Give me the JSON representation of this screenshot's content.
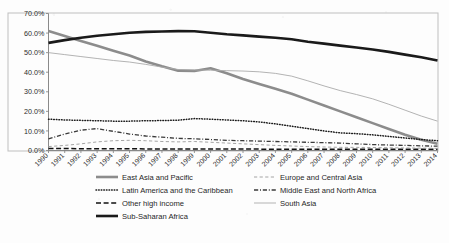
{
  "chart_data": {
    "type": "line",
    "title": "",
    "xlabel": "",
    "ylabel": "",
    "ylim": [
      0,
      70
    ],
    "ytick_labels": [
      "0.0%",
      "10.0%",
      "20.0%",
      "30.0%",
      "40.0%",
      "50.0%",
      "60.0%",
      "70.0%"
    ],
    "ytick_values": [
      0,
      10,
      20,
      30,
      40,
      50,
      60,
      70
    ],
    "grid": false,
    "legend_position": "bottom",
    "x": [
      1990,
      1991,
      1992,
      1993,
      1994,
      1995,
      1996,
      1997,
      1998,
      1999,
      2000,
      2001,
      2002,
      2003,
      2004,
      2005,
      2006,
      2007,
      2008,
      2009,
      2010,
      2011,
      2012,
      2013,
      2014
    ],
    "categories": [
      "1990",
      "1991",
      "1992",
      "1993",
      "1994",
      "1995",
      "1996",
      "1997",
      "1998",
      "1999",
      "2000",
      "2001",
      "2002",
      "2003",
      "2004",
      "2005",
      "2006",
      "2007",
      "2008",
      "2009",
      "2010",
      "2011",
      "2012",
      "2013",
      "2014"
    ],
    "series": [
      {
        "name": "East Asia and Pacific",
        "style": "solid-thick",
        "color": "#8c8c8c",
        "values": [
          61.0,
          58.5,
          56.0,
          53.5,
          51.0,
          48.5,
          45.5,
          43.0,
          40.8,
          40.6,
          42.0,
          39.5,
          36.5,
          34.0,
          31.5,
          29.0,
          26.0,
          23.0,
          20.0,
          17.0,
          14.0,
          11.0,
          8.0,
          5.5,
          3.5
        ]
      },
      {
        "name": "Latin America and the Caribbean",
        "style": "dotted",
        "color": "#1a1a1a",
        "values": [
          16.0,
          15.6,
          15.4,
          15.2,
          15.0,
          15.0,
          15.2,
          15.3,
          15.5,
          16.3,
          16.0,
          15.6,
          15.2,
          14.6,
          13.6,
          12.4,
          11.2,
          10.0,
          9.0,
          8.6,
          8.0,
          7.2,
          6.4,
          5.6,
          5.0
        ]
      },
      {
        "name": "Other high income",
        "style": "long-dash",
        "color": "#111111",
        "values": [
          1.0,
          1.0,
          0.9,
          0.9,
          0.9,
          0.9,
          0.8,
          0.8,
          0.8,
          0.8,
          0.8,
          0.8,
          0.8,
          0.7,
          0.7,
          0.7,
          0.7,
          0.7,
          0.7,
          0.7,
          0.7,
          0.7,
          0.7,
          0.7,
          0.7
        ]
      },
      {
        "name": "Sub-Saharan Africa",
        "style": "solid-thick",
        "color": "#1a1a1a",
        "values": [
          55.0,
          56.4,
          57.6,
          58.6,
          59.4,
          60.2,
          60.6,
          60.8,
          61.0,
          60.9,
          60.2,
          59.4,
          58.8,
          58.2,
          57.6,
          56.8,
          55.6,
          54.6,
          53.6,
          52.6,
          51.6,
          50.4,
          49.0,
          47.6,
          46.0
        ]
      },
      {
        "name": "Europe and Central Asia",
        "style": "dash",
        "color": "#9a9a9a",
        "values": [
          2.0,
          2.6,
          3.4,
          4.4,
          5.0,
          5.2,
          5.0,
          4.6,
          4.4,
          4.6,
          4.2,
          3.8,
          3.4,
          3.0,
          2.6,
          2.3,
          2.0,
          1.8,
          1.6,
          1.6,
          1.5,
          1.4,
          1.3,
          1.2,
          1.1
        ]
      },
      {
        "name": "Middle East and North Africa",
        "style": "dash-dot",
        "color": "#3a3a3a",
        "values": [
          6.0,
          8.4,
          10.4,
          11.2,
          9.8,
          8.4,
          7.4,
          6.8,
          6.2,
          6.0,
          5.6,
          5.2,
          5.0,
          4.8,
          4.6,
          4.4,
          4.2,
          4.0,
          3.8,
          3.4,
          3.0,
          2.8,
          2.6,
          2.4,
          2.2
        ]
      },
      {
        "name": "South Asia",
        "style": "solid-thin",
        "color": "#aaaaaa",
        "values": [
          50.0,
          49.0,
          48.0,
          47.0,
          46.0,
          45.2,
          44.0,
          42.6,
          41.4,
          41.2,
          41.0,
          40.8,
          40.6,
          40.2,
          39.4,
          38.0,
          35.6,
          33.0,
          30.6,
          28.6,
          26.4,
          23.6,
          20.6,
          17.6,
          15.0
        ]
      }
    ]
  },
  "legend": {
    "items": [
      {
        "label": "East Asia and Pacific",
        "style": "solid-thick",
        "color": "#8c8c8c"
      },
      {
        "label": "Europe and Central Asia",
        "style": "dash",
        "color": "#9a9a9a"
      },
      {
        "label": "Latin America and the Caribbean",
        "style": "dotted",
        "color": "#1a1a1a"
      },
      {
        "label": "Middle East and North Africa",
        "style": "dash-dot",
        "color": "#3a3a3a"
      },
      {
        "label": "Other high income",
        "style": "long-dash",
        "color": "#111111"
      },
      {
        "label": "South Asia",
        "style": "solid-thin",
        "color": "#aaaaaa"
      },
      {
        "label": "Sub-Saharan Africa",
        "style": "solid-thick",
        "color": "#1a1a1a"
      }
    ]
  },
  "axes": {
    "frame_color": "#bfbfbf",
    "axis_color": "#7d7d7d"
  }
}
